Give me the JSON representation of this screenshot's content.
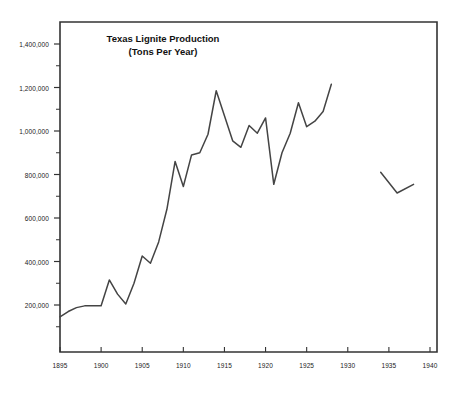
{
  "chart_data": {
    "type": "line",
    "title": "Texas Lignite Production",
    "subtitle": "(Tons Per Year)",
    "xlabel": "",
    "ylabel": "",
    "xlim": [
      1895,
      1940
    ],
    "ylim": [
      0,
      1500000
    ],
    "grid": false,
    "legend_position": "none",
    "x_ticks": [
      1895,
      1900,
      1905,
      1910,
      1915,
      1920,
      1925,
      1930,
      1935,
      1940
    ],
    "x_tick_labels": [
      "1895",
      "1900",
      "1905",
      "1910",
      "1915",
      "1920",
      "1925",
      "1930",
      "1935",
      "1940"
    ],
    "y_ticks": [
      200000,
      400000,
      600000,
      800000,
      1000000,
      1200000,
      1400000
    ],
    "y_tick_labels": [
      "200,000",
      "400,000",
      "600,000",
      "800,000",
      "1,000,000",
      "1,200,000",
      "1,400,000"
    ],
    "y_minor_tick_interval": 100000,
    "line_color": "#444444",
    "axis_color": "#333333",
    "series": [
      {
        "name": "Texas lignite production (main record)",
        "x": [
          1895,
          1896,
          1897,
          1898,
          1899,
          1900,
          1901,
          1902,
          1903,
          1904,
          1905,
          1906,
          1907,
          1908,
          1909,
          1910,
          1911,
          1912,
          1913,
          1914,
          1915,
          1916,
          1917,
          1918,
          1919,
          1920,
          1921,
          1922,
          1923,
          1924,
          1925,
          1926,
          1927,
          1928
        ],
        "values": [
          145000,
          170000,
          188000,
          196000,
          197000,
          197000,
          315000,
          250000,
          205000,
          300000,
          425000,
          392000,
          490000,
          640000,
          860000,
          745000,
          890000,
          900000,
          985000,
          1185000,
          1070000,
          955000,
          925000,
          1025000,
          990000,
          1060000,
          755000,
          900000,
          990000,
          1130000,
          1020000,
          1045000,
          1090000,
          1215000
        ]
      },
      {
        "name": "Texas lignite production (later partial record)",
        "x": [
          1934,
          1936,
          1938
        ],
        "values": [
          810000,
          715000,
          755000
        ]
      }
    ]
  }
}
